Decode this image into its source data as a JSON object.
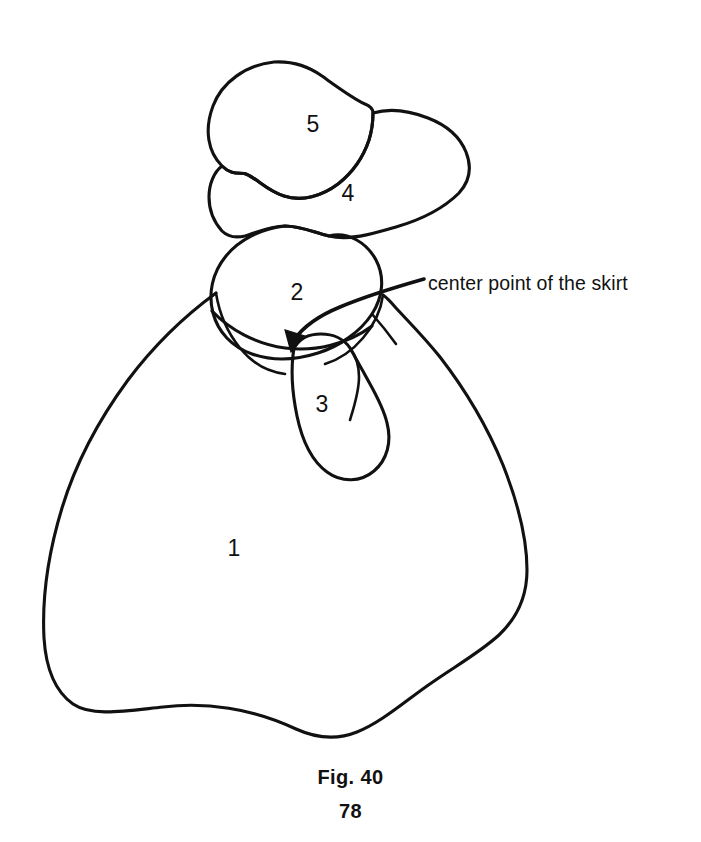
{
  "page": {
    "background_color": "#ffffff",
    "ink_color": "#111111",
    "width": 701,
    "height": 842
  },
  "figure": {
    "caption": "Fig. 40",
    "page_number": "78",
    "kind": "hand-drawn line illustration"
  },
  "annotations": [
    {
      "id": "center-point-callout",
      "text": "center point of the skirt",
      "leader": "curved arrow from label left-edge to the skirt center point",
      "text_x": 428,
      "text_y": 283
    }
  ],
  "regions": [
    {
      "number": "1",
      "name": "skirt",
      "label_x": 234,
      "label_y": 550
    },
    {
      "number": "2",
      "name": "bodice",
      "label_x": 297,
      "label_y": 294
    },
    {
      "number": "3",
      "name": "sleeve",
      "label_x": 322,
      "label_y": 406
    },
    {
      "number": "4",
      "name": "brim",
      "label_x": 348,
      "label_y": 195
    },
    {
      "number": "5",
      "name": "crown",
      "label_x": 313,
      "label_y": 126
    }
  ]
}
